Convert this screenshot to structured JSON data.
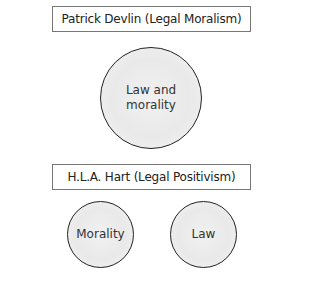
{
  "diagram": {
    "sections": [
      {
        "title": "Patrick Devlin (Legal Moralism)",
        "circles": [
          {
            "label": "Law and morality"
          }
        ]
      },
      {
        "title": "H.L.A. Hart (Legal Positivism)",
        "circles": [
          {
            "label": "Morality"
          },
          {
            "label": "Law"
          }
        ]
      }
    ]
  },
  "labels": {
    "devlin_title": "Patrick Devlin (Legal Moralism)",
    "devlin_circle_line1": "Law and",
    "devlin_circle_line2": "morality",
    "hart_title": "H.L.A. Hart (Legal Positivism)",
    "hart_circle_left": "Morality",
    "hart_circle_right": "Law"
  }
}
